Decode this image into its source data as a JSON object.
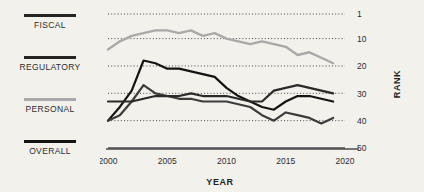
{
  "theme": {
    "background": "#f2f1ec",
    "dark_line": "#141414",
    "mid_line": "#3c3c3c",
    "light_line": "#a9a9a9",
    "grid": "#4a4a4a",
    "axis": "#4b4b4b",
    "text": "#2c2c2c"
  },
  "legend": {
    "items": [
      {
        "label": "FISCAL",
        "color": "#242424",
        "swatch": "line-swatch"
      },
      {
        "label": "REGULATORY",
        "color": "#242424",
        "swatch": "line-swatch"
      },
      {
        "label": "PERSONAL",
        "color": "#a9a9a9",
        "swatch": "line-swatch"
      },
      {
        "label": "OVERALL",
        "color": "#141414",
        "swatch": "line-swatch"
      }
    ]
  },
  "chart_data": {
    "type": "line",
    "title": "",
    "xlabel": "YEAR",
    "ylabel": "RANK",
    "x": [
      2000,
      2001,
      2002,
      2003,
      2004,
      2005,
      2006,
      2007,
      2008,
      2009,
      2010,
      2011,
      2012,
      2013,
      2014,
      2015,
      2016,
      2017,
      2018,
      2019
    ],
    "xlim": [
      2000,
      2020
    ],
    "xticks": [
      2000,
      2005,
      2010,
      2015,
      2020
    ],
    "xticklabels": [
      "2000",
      "2005",
      "2010",
      "2015",
      "2020"
    ],
    "ylim": [
      1,
      50
    ],
    "yticks": [
      1,
      10,
      20,
      30,
      40,
      50
    ],
    "yticklabels": [
      "1",
      "10",
      "20",
      "30",
      "40",
      "50"
    ],
    "y_inverted": true,
    "grid": "horizontal-dotted",
    "legend_position": "left-outside",
    "series": [
      {
        "name": "PERSONAL",
        "color": "#a9a9a9",
        "width": 2.4,
        "values": [
          14,
          11,
          9,
          8,
          7,
          7,
          8,
          7,
          9,
          8,
          10,
          11,
          12,
          11,
          12,
          13,
          16,
          15,
          17,
          19
        ]
      },
      {
        "name": "REGULATORY",
        "color": "#141414",
        "width": 2.2,
        "values": [
          40,
          35,
          29,
          18,
          19,
          21,
          21,
          22,
          23,
          24,
          28,
          31,
          33,
          35,
          36,
          33,
          31,
          31,
          32,
          33
        ]
      },
      {
        "name": "FISCAL",
        "color": "#3c3c3c",
        "width": 2.2,
        "values": [
          40,
          38,
          33,
          27,
          30,
          31,
          32,
          32,
          33,
          33,
          33,
          34,
          35,
          38,
          40,
          37,
          38,
          39,
          41,
          39
        ]
      },
      {
        "name": "OVERALL",
        "color": "#2a2a2a",
        "width": 2.2,
        "values": [
          33,
          33,
          33,
          32,
          31,
          31,
          31,
          30,
          31,
          31,
          31,
          32,
          33,
          33,
          29,
          28,
          27,
          28,
          29,
          30
        ]
      }
    ]
  }
}
